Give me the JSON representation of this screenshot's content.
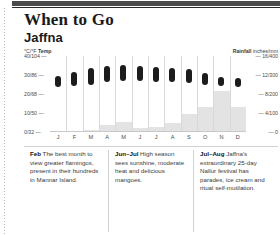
{
  "header": {
    "title": "When to Go",
    "subtitle": "Jaffna"
  },
  "axes": {
    "left_caption_unit": "°C/°F",
    "left_caption_label": "Temp",
    "right_caption_label": "Rainfall",
    "right_caption_unit": "inches/mm",
    "left_ticks": [
      "40/104",
      "30/86",
      "20/68",
      "10/50",
      "0/32"
    ],
    "right_ticks": [
      "16/400",
      "12/300",
      "8/200",
      "4/100",
      "0"
    ],
    "tick_dash": "—"
  },
  "chart_data": {
    "type": "bar",
    "xlabel": "",
    "ylabel": "Temp °C/°F",
    "categories": [
      "J",
      "F",
      "M",
      "A",
      "M",
      "J",
      "J",
      "A",
      "S",
      "O",
      "N",
      "D"
    ],
    "grid": true,
    "legend": "none",
    "series": [
      {
        "name": "Temp",
        "unit": "°C",
        "type": "range-bar",
        "ylim": [
          0,
          40
        ],
        "low": [
          23.5,
          24.0,
          25.0,
          26.5,
          27.0,
          27.0,
          26.5,
          26.5,
          26.0,
          25.0,
          24.0,
          23.5
        ],
        "high": [
          29.5,
          31.5,
          33.5,
          34.5,
          35.5,
          34.5,
          34.0,
          33.5,
          33.0,
          31.0,
          29.0,
          28.5
        ]
      },
      {
        "name": "Rainfall",
        "unit": "mm",
        "type": "column",
        "ylim": [
          0,
          400
        ],
        "values": [
          0,
          0,
          10,
          35,
          55,
          20,
          25,
          45,
          95,
          130,
          215,
          130
        ]
      }
    ]
  },
  "notes": [
    {
      "lead": "Feb",
      "text": "The best month to view greater flamingos, present in their hundreds in Mannar Island."
    },
    {
      "lead": "Jun–Jul",
      "text": "High season sees sunshine, moderate heat and delicious mangoes."
    },
    {
      "lead": "Jul–Aug",
      "text": "Jaffna's extraordinary 25-day Nallur festival has parades, ice cream and ritual self-mutilation."
    }
  ]
}
